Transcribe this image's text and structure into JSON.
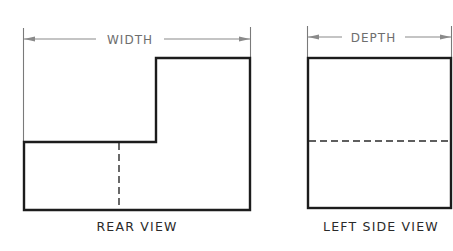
{
  "drawing": {
    "type": "orthographic multiview drawing",
    "views": [
      {
        "name": "rear-view",
        "label": "REAR VIEW",
        "dimension": {
          "label": "WIDTH"
        },
        "features": [
          "L-shaped outline with step at upper left",
          "vertical hidden line in lower portion"
        ]
      },
      {
        "name": "left-side-view",
        "label": "LEFT SIDE VIEW",
        "dimension": {
          "label": "DEPTH"
        },
        "features": [
          "rectangular outline",
          "horizontal hidden line at step height"
        ]
      }
    ]
  },
  "colors": {
    "object_line": "#1c1c1c",
    "dimension_line": "#8a8a8a",
    "text": "#2a2a2a",
    "background": "#ffffff"
  }
}
